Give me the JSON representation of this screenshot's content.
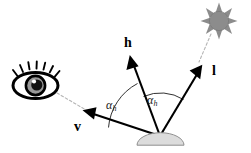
{
  "diagram": {
    "background_color": "#ffffff",
    "stroke_color": "#000000",
    "dashed_color": "#b0b0b0",
    "surface_fill": "#d9d9d9",
    "surface_stroke": "#8c8c8c",
    "sun_fill": "#8c8c8c",
    "sun_stroke": "#8c8c8c",
    "eye_color": "#000000",
    "labels": {
      "halfway_vector": "h",
      "light_vector": "l",
      "view_vector": "v",
      "angle_left": "α",
      "angle_left_sub": "h",
      "angle_right": "α",
      "angle_right_sub": "h"
    },
    "icons": {
      "eye": "eye-icon",
      "sun": "sun-icon"
    },
    "geometry": {
      "origin": [
        160,
        136
      ],
      "h_tip": [
        130,
        57
      ],
      "l_tip": [
        201,
        66
      ],
      "v_tip": [
        83,
        110
      ],
      "eye_center": [
        35,
        84
      ],
      "sun_center": [
        219,
        21
      ]
    }
  }
}
